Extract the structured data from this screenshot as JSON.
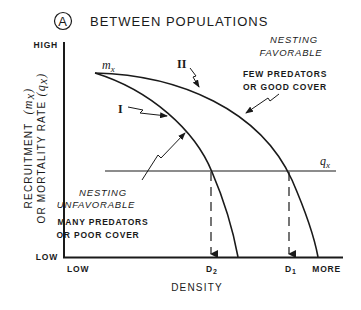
{
  "figure": {
    "panel_letter": "A",
    "title": "BETWEEN POPULATIONS"
  },
  "axes": {
    "y_label_line1": "RECRUITMENT",
    "y_label_line1_var": "(m",
    "y_label_line1_sub": "x",
    "y_label_line1_close": ")",
    "y_label_line2": "OR MORTALITY RATE",
    "y_label_line2_var": "(q",
    "y_label_line2_sub": "x",
    "y_label_line2_close": ")",
    "y_high": "HIGH",
    "y_low": "LOW",
    "x_low": "LOW",
    "x_more": "MORE",
    "x_title": "DENSITY"
  },
  "curves": {
    "start_label_main": "m",
    "start_label_sub": "x",
    "curve_1_label": "I",
    "curve_2_label": "II",
    "mortality_label_main": "q",
    "mortality_label_sub": "x"
  },
  "markers": {
    "d2_main": "D",
    "d2_sub": "2",
    "d1_main": "D",
    "d1_sub": "1"
  },
  "annotations": {
    "favorable_line1": "NESTING",
    "favorable_line2": "FAVORABLE",
    "favorable_desc_line1": "FEW PREDATORS",
    "favorable_desc_line2": "OR GOOD COVER",
    "unfavorable_line1": "NESTING",
    "unfavorable_line2": "UNFAVORABLE",
    "unfavorable_desc_line1": "MANY PREDATORS",
    "unfavorable_desc_line2": "OR POOR COVER"
  },
  "colors": {
    "ink": "#1a1a1a",
    "background": "#ffffff"
  }
}
